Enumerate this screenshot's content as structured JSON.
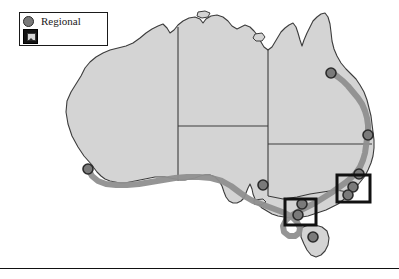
{
  "figure": {
    "kind": "map",
    "region": "Australia",
    "background_color": "#ffffff"
  },
  "legend": {
    "name": "map-legend",
    "border_color": "#1a1a1a",
    "background_color": "#ffffff",
    "items": [
      {
        "icon": "circle-marker-icon",
        "label": "Regional",
        "swatch_fill": "#7a7a7a",
        "swatch_stroke": "#2b2b2b"
      },
      {
        "icon": "image-placeholder-icon",
        "label": "",
        "swatch_fill": "#141414",
        "swatch_stroke": "#000000"
      }
    ]
  },
  "map": {
    "landmass_fill": "#d4d4d4",
    "landmass_stroke": "#3c3c3c",
    "border_stroke": "#3c3c3c",
    "route_color": "#8f8f8f",
    "route_stroke_width": 6,
    "marker_fill": "#7a7a7a",
    "marker_stroke": "#2b2b2b",
    "marker_radius": 5,
    "selection_box_color": "#111111",
    "markers": [
      {
        "name": "marker-perth",
        "x": 88,
        "y": 169
      },
      {
        "name": "marker-adelaide",
        "x": 263,
        "y": 185
      },
      {
        "name": "marker-melbourne-a",
        "x": 302,
        "y": 204
      },
      {
        "name": "marker-melbourne-b",
        "x": 298,
        "y": 215
      },
      {
        "name": "marker-hobart",
        "x": 313,
        "y": 237
      },
      {
        "name": "marker-sydney",
        "x": 359,
        "y": 174
      },
      {
        "name": "marker-canberra-a",
        "x": 353,
        "y": 187
      },
      {
        "name": "marker-canberra-b",
        "x": 348,
        "y": 195
      },
      {
        "name": "marker-brisbane",
        "x": 368,
        "y": 135
      },
      {
        "name": "marker-cairns",
        "x": 331,
        "y": 73
      }
    ],
    "selection_boxes": [
      {
        "name": "selection-box-melbourne",
        "x": 285,
        "y": 199,
        "width": 31,
        "height": 26
      },
      {
        "name": "selection-box-sydney",
        "x": 337,
        "y": 175,
        "width": 33,
        "height": 27
      }
    ],
    "state_border_count": 5,
    "islands": [
      {
        "name": "island-melville"
      },
      {
        "name": "island-groote-eylandt"
      },
      {
        "name": "island-tasmania"
      },
      {
        "name": "island-kangaroo"
      }
    ]
  },
  "bottom_rule": {
    "name": "bottom-horizontal-rule",
    "color": "#111111"
  }
}
